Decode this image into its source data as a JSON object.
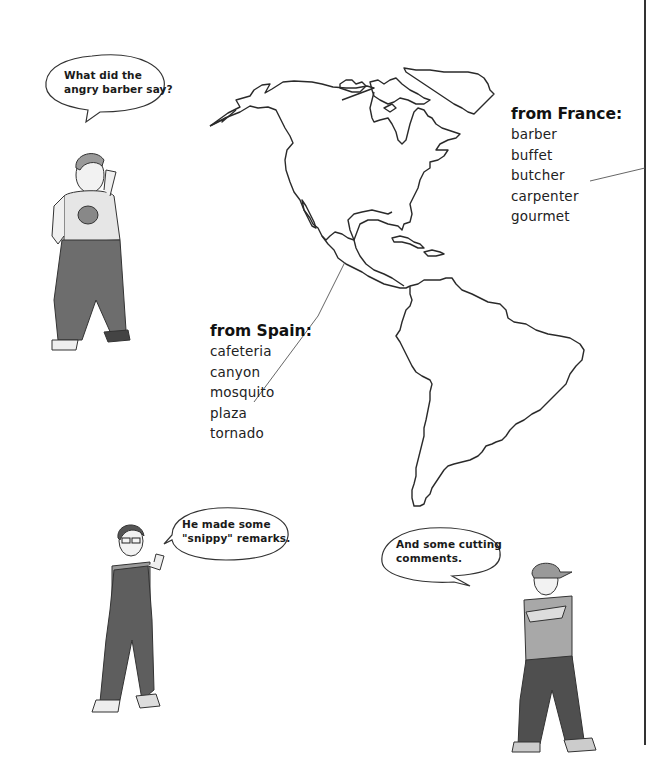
{
  "page": {
    "background": "#ffffff",
    "line_color": "#2a2a2a"
  },
  "bubbles": [
    {
      "id": "bubble-top-left",
      "speaker": "boy-thinking",
      "lines": [
        "What did the",
        "angry barber say?"
      ]
    },
    {
      "id": "bubble-bottom-left",
      "speaker": "girl-glasses",
      "lines": [
        "He made some",
        "\"snippy\" remarks."
      ]
    },
    {
      "id": "bubble-bottom-right",
      "speaker": "boy-cap",
      "lines": [
        "And some cutting",
        "comments."
      ]
    }
  ],
  "lists": {
    "france": {
      "heading": "from France:",
      "items": [
        "barber",
        "buffet",
        "butcher",
        "carpenter",
        "gourmet"
      ]
    },
    "spain": {
      "heading": "from Spain:",
      "items": [
        "cafeteria",
        "canyon",
        "mosquito",
        "plaza",
        "tornado"
      ]
    }
  },
  "map": {
    "subject": "North and South America outline map",
    "icon": "americas-map"
  },
  "characters": [
    {
      "name": "boy-thinking",
      "shirt": "#e6e6e6",
      "pants": "#6d6d6d"
    },
    {
      "name": "girl-glasses",
      "shirt": "#9a9a9a",
      "pants": "#5e5e5e"
    },
    {
      "name": "boy-cap",
      "shirt": "#a8a8a8",
      "pants": "#4f4f4f"
    }
  ]
}
